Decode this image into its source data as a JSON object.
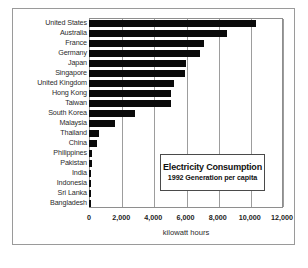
{
  "chart_data": {
    "type": "bar",
    "orientation": "horizontal",
    "title": "Electricity Consumption",
    "subtitle": "1992 Generation per capita",
    "xlabel": "kilowatt hours",
    "ylabel": "",
    "xlim": [
      0,
      12000
    ],
    "xticks": [
      "0",
      "2,000",
      "4,000",
      "6,000",
      "8,000",
      "10,000",
      "12,000"
    ],
    "xtick_values": [
      0,
      2000,
      4000,
      6000,
      8000,
      10000,
      12000
    ],
    "grid": true,
    "legend_position": "inside-lower-right",
    "bar_color": "#0a0a0a",
    "categories": [
      "United States",
      "Australia",
      "France",
      "Germany",
      "Japan",
      "Singapore",
      "United Kingdom",
      "Hong Kong",
      "Taiwan",
      "South Korea",
      "Malaysia",
      "Thailand",
      "China",
      "Philippines",
      "Pakistan",
      "India",
      "Indonesia",
      "Sri Lanka",
      "Bangladesh"
    ],
    "values": [
      10400,
      8600,
      7150,
      6900,
      6030,
      5960,
      5280,
      5100,
      5100,
      2860,
      1620,
      620,
      500,
      190,
      190,
      90,
      60,
      50,
      20
    ]
  }
}
